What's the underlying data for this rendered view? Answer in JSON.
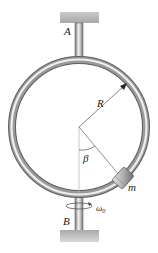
{
  "diagram": {
    "labels": {
      "support_top": "A",
      "support_bottom": "B",
      "radius": "R",
      "angle": "β",
      "mass": "m",
      "angular_velocity": "ω",
      "angular_velocity_sub": "0"
    },
    "colors": {
      "tube_dark": "#6e6e6e",
      "tube_light": "#e8e8e8",
      "support": "#b8b8b8",
      "line": "#555555"
    }
  }
}
